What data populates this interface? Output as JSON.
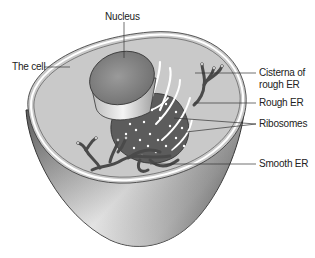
{
  "diagram": {
    "colors": {
      "cytoplasm": "#c8c8c8",
      "rim": "#ffffff",
      "outline": "#333333",
      "nucleus_top": "#8a8a8a",
      "nucleus_side": "#e6e6e6",
      "er": "#5c5c5c",
      "ribosome": "#ffffff",
      "leader_line": "#333333"
    },
    "labels": {
      "nucleus": "Nucleus",
      "cell": "The cell",
      "cisterna_line1": "Cisterna of",
      "cisterna_line2": "rough ER",
      "rough_er": "Rough ER",
      "ribosomes": "Ribosomes",
      "smooth_er": "Smooth ER"
    }
  }
}
